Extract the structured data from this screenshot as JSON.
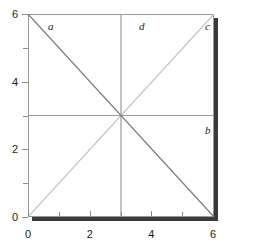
{
  "chart_data": {
    "type": "line",
    "title": "",
    "xlabel": "",
    "ylabel": "",
    "xlim": [
      0,
      6
    ],
    "ylim": [
      0,
      6
    ],
    "grid": false,
    "legend_position": "inline-labels",
    "x_major_ticks": [
      0,
      2,
      4,
      6
    ],
    "x_minor_ticks": [
      1,
      3,
      5
    ],
    "y_major_ticks": [
      0,
      2,
      4,
      6
    ],
    "y_minor_ticks": [
      1,
      3,
      5
    ],
    "x_tick_labels": [
      "0",
      "2",
      "4",
      "6"
    ],
    "y_tick_labels": [
      "0",
      "2",
      "4",
      "6"
    ],
    "series": [
      {
        "name": "a",
        "label": "a",
        "color": "#7a7a7a",
        "x": [
          0,
          6
        ],
        "values": [
          6,
          0
        ],
        "description": "descending diagonal"
      },
      {
        "name": "b",
        "label": "b",
        "color": "#9a9a9a",
        "x": [
          0,
          6
        ],
        "values": [
          3,
          3
        ],
        "description": "horizontal at y=3"
      },
      {
        "name": "c",
        "label": "c",
        "color": "#c4c4c4",
        "x": [
          0,
          6
        ],
        "values": [
          0,
          6
        ],
        "description": "ascending diagonal"
      },
      {
        "name": "d",
        "label": "d",
        "color": "#9a9a9a",
        "x": [
          3,
          3
        ],
        "values": [
          0,
          6
        ],
        "description": "vertical at x=3"
      }
    ],
    "intersection_point": [
      3,
      3
    ]
  },
  "axes": {
    "x_labels": [
      "0",
      "2",
      "4",
      "6"
    ],
    "y_labels": [
      "0",
      "2",
      "4",
      "6"
    ]
  },
  "annotations": {
    "a": "a",
    "b": "b",
    "c": "c",
    "d": "d"
  },
  "colors": {
    "line_a": "#7a7a7a",
    "line_b": "#9a9a9a",
    "line_c": "#c4c4c4",
    "line_d": "#9a9a9a",
    "frame": "#9a9a9a",
    "shadow": "#3a3a3a",
    "text": "#1a1a1a",
    "background": "#ffffff"
  }
}
